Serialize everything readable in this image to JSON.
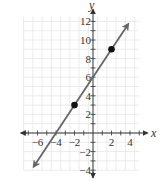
{
  "chart_data": {
    "type": "line",
    "title": "",
    "xlabel": "x",
    "ylabel": "y",
    "xlim": [
      -7.5,
      5
    ],
    "ylim": [
      -4,
      12.5
    ],
    "grid": true,
    "x_ticks": [
      -6,
      -4,
      -2,
      2,
      4
    ],
    "y_ticks": [
      12,
      10,
      8,
      6,
      4,
      2,
      -2,
      -4
    ],
    "x_tick_labels": [
      "−6",
      "−4",
      "−2",
      "2",
      "4"
    ],
    "y_tick_labels": [
      "12",
      "10",
      "8",
      "6",
      "4",
      "2",
      "−2",
      "−4"
    ],
    "series": [
      {
        "name": "line",
        "equation": "y = 1.5x + 6",
        "slope": 1.5,
        "y_intercept": 6,
        "x_intercept": -4,
        "arrows": "both ends",
        "color": "#666666"
      }
    ],
    "points": [
      {
        "x": -2,
        "y": 3
      },
      {
        "x": 2,
        "y": 9
      }
    ]
  },
  "colors": {
    "grid": "#e6e6e6",
    "axis": "#333333",
    "line": "#666666",
    "point": "#111111"
  }
}
